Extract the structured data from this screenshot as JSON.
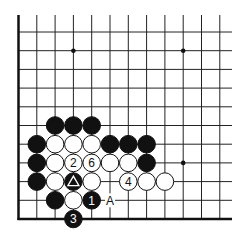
{
  "board": {
    "cols": 12,
    "rows": 11,
    "x0": 18.5,
    "y0": 32,
    "dx": 18.3,
    "dy": 18.7,
    "right_extent": 232,
    "line_color": "#222222",
    "edge_left": true,
    "edge_bottom": true,
    "star_points": [
      [
        3,
        1
      ],
      [
        9,
        1
      ],
      [
        9,
        7
      ]
    ]
  },
  "stones": [
    {
      "c": 2,
      "r": 5,
      "color": "black"
    },
    {
      "c": 3,
      "r": 5,
      "color": "black"
    },
    {
      "c": 4,
      "r": 5,
      "color": "black"
    },
    {
      "c": 1,
      "r": 6,
      "color": "black"
    },
    {
      "c": 2,
      "r": 6,
      "color": "white"
    },
    {
      "c": 3,
      "r": 6,
      "color": "white"
    },
    {
      "c": 4,
      "r": 6,
      "color": "white"
    },
    {
      "c": 5,
      "r": 6,
      "color": "black"
    },
    {
      "c": 6,
      "r": 6,
      "color": "black"
    },
    {
      "c": 7,
      "r": 6,
      "color": "black"
    },
    {
      "c": 1,
      "r": 7,
      "color": "black"
    },
    {
      "c": 2,
      "r": 7,
      "color": "white"
    },
    {
      "c": 3,
      "r": 7,
      "color": "white",
      "label": "2"
    },
    {
      "c": 4,
      "r": 7,
      "color": "white",
      "label": "6"
    },
    {
      "c": 5,
      "r": 7,
      "color": "white"
    },
    {
      "c": 6,
      "r": 7,
      "color": "white"
    },
    {
      "c": 7,
      "r": 7,
      "color": "black"
    },
    {
      "c": 1,
      "r": 8,
      "color": "black"
    },
    {
      "c": 2,
      "r": 8,
      "color": "white"
    },
    {
      "c": 3,
      "r": 8,
      "color": "black",
      "mark": "triangle"
    },
    {
      "c": 4,
      "r": 8,
      "color": "white"
    },
    {
      "c": 6,
      "r": 8,
      "color": "white",
      "label": "4"
    },
    {
      "c": 7,
      "r": 8,
      "color": "white"
    },
    {
      "c": 8,
      "r": 8,
      "color": "white"
    },
    {
      "c": 2,
      "r": 9,
      "color": "black"
    },
    {
      "c": 3,
      "r": 9,
      "color": "white"
    },
    {
      "c": 4,
      "r": 9,
      "color": "black",
      "label": "1"
    },
    {
      "c": 3,
      "r": 10,
      "color": "black",
      "label": "3"
    }
  ],
  "board_labels": [
    {
      "c": 5,
      "r": 9,
      "text": "A"
    }
  ]
}
